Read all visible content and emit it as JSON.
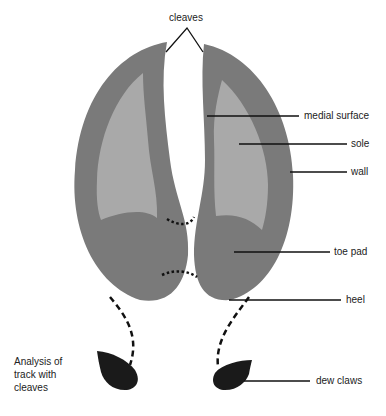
{
  "title": "cleaves",
  "labels": {
    "medial_surface": "medial surface",
    "sole": "sole",
    "wall": "wall",
    "toe_pad": "toe pad",
    "heel": "heel",
    "dew_claws": "dew claws"
  },
  "caption": {
    "line1": "Analysis of",
    "line2": "track with",
    "line3": "cleaves"
  },
  "colors": {
    "wall": "#7a7a7a",
    "sole": "#a9a9a9",
    "dew_claw": "#1a1a1a",
    "line": "#111111"
  }
}
